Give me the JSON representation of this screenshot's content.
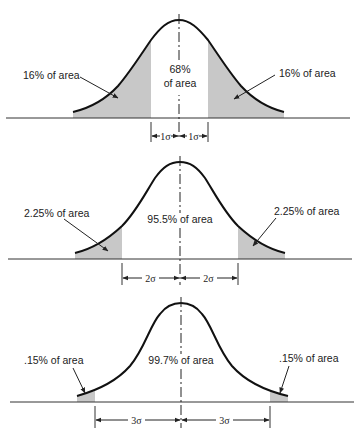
{
  "colors": {
    "curve": "#111111",
    "shade": "#c8c8c8",
    "axis": "#333333",
    "text": "#222222"
  },
  "panels": [
    {
      "id": "one-sigma",
      "center_label_line1": "68%",
      "center_label_line2": "of area",
      "left_label": "16% of area",
      "right_label": "16% of area",
      "sigma_left": "1σ",
      "sigma_right": "1σ"
    },
    {
      "id": "two-sigma",
      "center_label": "95.5% of area",
      "left_label": "2.25% of area",
      "right_label": "2.25% of area",
      "sigma_left": "2σ",
      "sigma_right": "2σ"
    },
    {
      "id": "three-sigma",
      "center_label": "99.7% of area",
      "left_label": ".15% of area",
      "right_label": ".15% of area",
      "sigma_left": "3σ",
      "sigma_right": "3σ"
    }
  ]
}
